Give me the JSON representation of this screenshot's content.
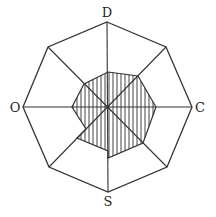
{
  "diagram": {
    "type": "octagonal-radar",
    "axes": [
      {
        "key": "top",
        "label": "D"
      },
      {
        "key": "right",
        "label": "C"
      },
      {
        "key": "bottom",
        "label": "S"
      },
      {
        "key": "left",
        "label": "O"
      }
    ],
    "colors": {
      "line": "#333333",
      "hatch": "#444444",
      "background": "#ffffff"
    },
    "outer_octagon": [
      [
        107,
        22
      ],
      [
        166,
        47
      ],
      [
        192,
        107
      ],
      [
        167,
        167
      ],
      [
        108,
        192
      ],
      [
        49,
        167
      ],
      [
        23,
        107
      ],
      [
        48,
        47
      ]
    ],
    "center": [
      108,
      107
    ],
    "profile_polygon": [
      [
        108,
        72
      ],
      [
        138,
        76
      ],
      [
        156,
        107
      ],
      [
        143,
        143
      ],
      [
        108,
        158
      ],
      [
        108,
        151
      ],
      [
        77,
        138
      ],
      [
        86,
        129
      ],
      [
        72,
        107
      ],
      [
        84,
        84
      ]
    ]
  }
}
